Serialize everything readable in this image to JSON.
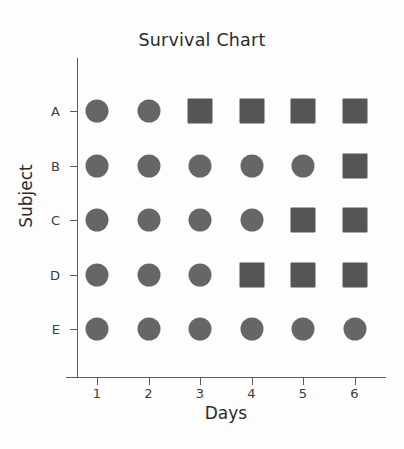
{
  "chart_data": {
    "type": "scatter",
    "title": "Survival Chart",
    "xlabel": "Days",
    "ylabel": "Subject",
    "categories": [
      "1",
      "2",
      "3",
      "4",
      "5",
      "6"
    ],
    "x": [
      1,
      2,
      3,
      4,
      5,
      6
    ],
    "y_categories": [
      "A",
      "B",
      "C",
      "D",
      "E"
    ],
    "xlim": [
      0.55,
      6.45
    ],
    "grid": false,
    "legend": null,
    "marker_shapes": [
      "circle",
      "square"
    ],
    "colors": {
      "circle": "#666666",
      "square": "#555555",
      "axis": "#5a5a5a",
      "text": "#2b2b2b",
      "background": "#fdfdfd"
    },
    "series": [
      {
        "name": "A",
        "values": [
          "circle",
          "circle",
          "square",
          "square",
          "square",
          "square"
        ]
      },
      {
        "name": "B",
        "values": [
          "circle",
          "circle",
          "circle",
          "circle",
          "circle",
          "square"
        ]
      },
      {
        "name": "C",
        "values": [
          "circle",
          "circle",
          "circle",
          "circle",
          "square",
          "square"
        ]
      },
      {
        "name": "D",
        "values": [
          "circle",
          "circle",
          "circle",
          "square",
          "square",
          "square"
        ]
      },
      {
        "name": "E",
        "values": [
          "circle",
          "circle",
          "circle",
          "circle",
          "circle",
          "circle"
        ]
      }
    ]
  }
}
